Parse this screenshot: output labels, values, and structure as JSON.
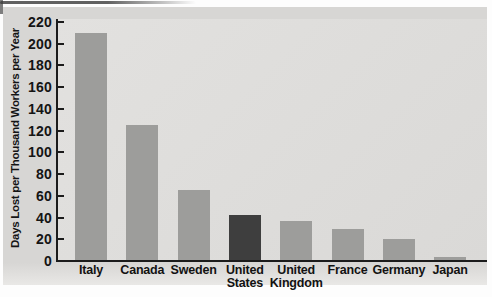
{
  "chart_data": {
    "type": "bar",
    "title": "",
    "xlabel": "",
    "ylabel": "Days Lost per Thousand Workers per Year",
    "categories": [
      "Italy",
      "Canada",
      "Sweden",
      "United States",
      "United Kingdom",
      "France",
      "Germany",
      "Japan"
    ],
    "values": [
      210,
      125,
      65,
      42,
      37,
      29,
      20,
      4
    ],
    "ylim": [
      0,
      220
    ],
    "ytick_step": 20,
    "yticks": [
      0,
      20,
      40,
      60,
      80,
      100,
      120,
      140,
      160,
      180,
      200,
      220
    ],
    "grid": "off",
    "legend": "none",
    "highlight_category": "United States",
    "colors": {
      "bar": "#9d9d9b",
      "highlight_bar": "#3e3e3e",
      "axis": "#1b1b1b",
      "panel_bg": "#d7d6d4",
      "plot_bg": "#dedddb",
      "text": "#141414"
    }
  }
}
